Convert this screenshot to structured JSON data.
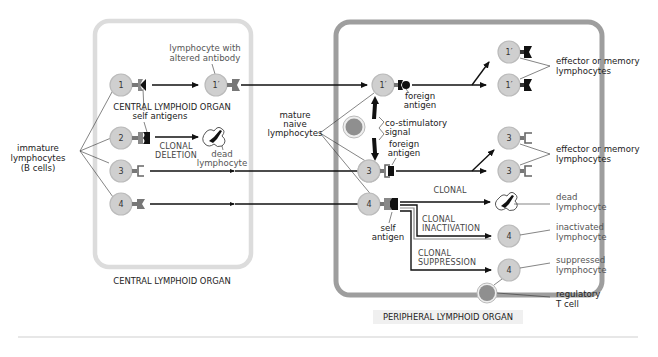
{
  "diagram": {
    "title_central": "CENTRAL LYMPHOID ORGAN",
    "title_peripheral": "PERIPHERAL LYMPHOID ORGAN",
    "colors": {
      "central_border": "#dcdcdc",
      "peripheral_border": "#9e9e9e",
      "cell_fill": "#cfcfcf",
      "regulatory_cell_fill": "#8f8f8f",
      "arrow": "#111111"
    },
    "left_labels": {
      "immature_1": "immature",
      "immature_2": "lymphocytes",
      "immature_3": "(B cells)",
      "altered_1": "lymphocyte with",
      "altered_2": "altered antibody",
      "self_antigens": "self antigens",
      "clonal_deletion_1": "CLONAL",
      "clonal_deletion_2": "DELETION",
      "dead_1": "dead",
      "dead_2": "lymphocyte"
    },
    "middle_labels": {
      "mature_1": "mature",
      "mature_2": "naive",
      "mature_3": "lymphocytes"
    },
    "peripheral_labels": {
      "foreign_antigen_1a": "foreign",
      "foreign_antigen_1b": "antigen",
      "costim_1": "co-stimulatory",
      "costim_2": "signal",
      "foreign_antigen_3a": "foreign",
      "foreign_antigen_3b": "antigen",
      "self_antigen_1": "self",
      "self_antigen_2": "antigen",
      "clonal_deletion_1": "CLONAL",
      "clonal_deletion_2": "DELETION",
      "clonal_inactivation_1": "CLONAL",
      "clonal_inactivation_2": "INACTIVATION",
      "clonal_suppression_1": "CLONAL",
      "clonal_suppression_2": "SUPPRESSION"
    },
    "right_labels": {
      "effector1_1": "effector or memory",
      "effector1_2": "lymphocytes",
      "effector3_1": "effector or memory",
      "effector3_2": "lymphocytes",
      "dead_1": "dead",
      "dead_2": "lymphocyte",
      "inactivated_1": "inactivated",
      "inactivated_2": "lymphocyte",
      "suppressed_1": "suppressed",
      "suppressed_2": "lymphocyte",
      "regulatory_1": "regulatory",
      "regulatory_2": "T cell"
    },
    "cells": {
      "c1": "1",
      "c2": "2",
      "c3": "3",
      "c4": "4",
      "c1p": "1′",
      "p1p": "1′",
      "p3": "3",
      "p4": "4",
      "r1a": "1′",
      "r1b": "1′",
      "r3a": "3",
      "r3b": "3",
      "r4a": "4",
      "r4b": "4"
    }
  }
}
